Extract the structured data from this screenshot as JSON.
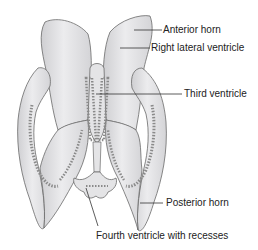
{
  "diagram": {
    "labels": [
      {
        "id": "anterior-horn",
        "text": "Anterior horn"
      },
      {
        "id": "right-lateral-ventricle",
        "text": "Right lateral ventricle"
      },
      {
        "id": "third-ventricle",
        "text": "Third ventricle"
      },
      {
        "id": "posterior-horn",
        "text": "Posterior horn"
      },
      {
        "id": "fourth-ventricle",
        "text": "Fourth ventricle with recesses"
      }
    ],
    "colors": {
      "fill": "#e6e6e8",
      "fill_shadow": "#c9c9cc",
      "outline": "#6a6a6a",
      "plexus": "#8a8a8a",
      "leader_line": "#333333",
      "text": "#222222"
    }
  }
}
